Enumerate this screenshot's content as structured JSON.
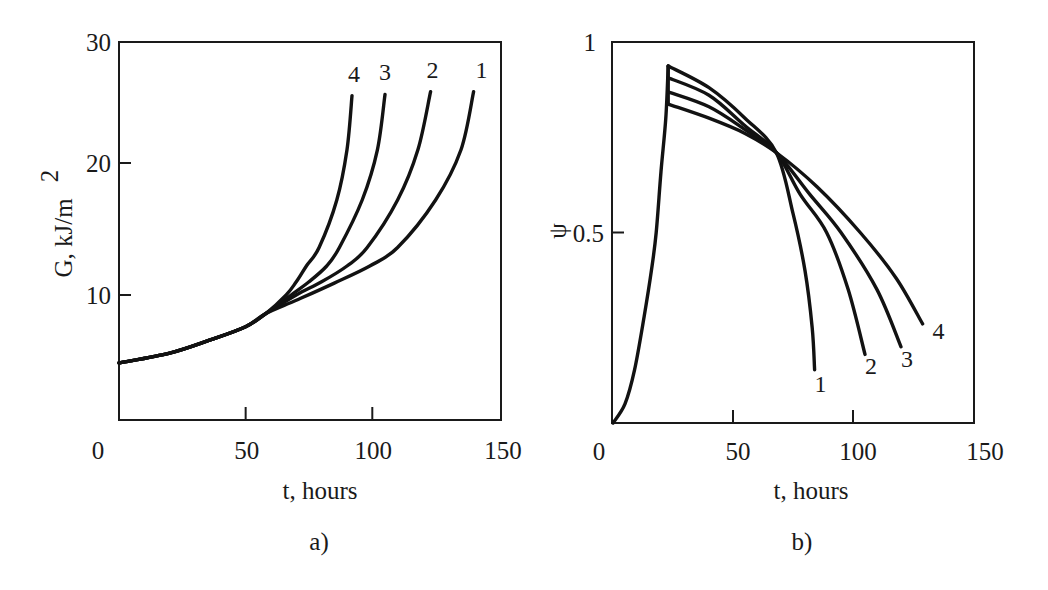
{
  "chart_data": [
    {
      "type": "line",
      "panel_label": "a)",
      "xlabel": "t, hours",
      "ylabel": "G, kJ/m",
      "ylabel_sup": "2",
      "xlim": [
        0,
        150
      ],
      "ylim": [
        0,
        30
      ],
      "xticks": [
        0,
        50,
        100,
        150
      ],
      "yticks": [
        10,
        20,
        30
      ],
      "grid": false,
      "legend": "inline numeric labels at curve ends",
      "series": [
        {
          "name": "1",
          "points": [
            [
              0,
              4.85
            ],
            [
              20,
              5.6
            ],
            [
              36,
              6.6
            ],
            [
              50,
              7.6
            ],
            [
              58,
              8.6
            ],
            [
              70,
              9.6
            ],
            [
              85,
              10.9
            ],
            [
              99,
              12.2
            ],
            [
              110,
              13.6
            ],
            [
              125,
              17.2
            ],
            [
              135,
              21.0
            ],
            [
              140,
              25.4
            ]
          ]
        },
        {
          "name": "2",
          "points": [
            [
              0,
              4.85
            ],
            [
              20,
              5.6
            ],
            [
              36,
              6.6
            ],
            [
              50,
              7.6
            ],
            [
              58,
              8.6
            ],
            [
              70,
              10.0
            ],
            [
              80,
              11.0
            ],
            [
              90,
              12.2
            ],
            [
              98,
              13.6
            ],
            [
              110,
              17.2
            ],
            [
              118,
              21.0
            ],
            [
              123,
              25.4
            ]
          ]
        },
        {
          "name": "3",
          "points": [
            [
              0,
              4.85
            ],
            [
              20,
              5.6
            ],
            [
              36,
              6.6
            ],
            [
              50,
              7.6
            ],
            [
              58,
              8.6
            ],
            [
              68,
              10.0
            ],
            [
              75,
              11.0
            ],
            [
              82,
              12.2
            ],
            [
              87,
              13.6
            ],
            [
              96,
              17.2
            ],
            [
              102,
              21.0
            ],
            [
              105,
              25.2
            ]
          ]
        },
        {
          "name": "4",
          "points": [
            [
              0,
              4.85
            ],
            [
              20,
              5.6
            ],
            [
              36,
              6.6
            ],
            [
              50,
              7.6
            ],
            [
              58,
              8.6
            ],
            [
              66,
              10.0
            ],
            [
              70,
              11.0
            ],
            [
              74,
              12.2
            ],
            [
              79,
              13.6
            ],
            [
              86,
              17.2
            ],
            [
              90,
              21.0
            ],
            [
              92,
              25.1
            ]
          ]
        }
      ]
    },
    {
      "type": "line",
      "panel_label": "b)",
      "xlabel": "t, hours",
      "ylabel": "ψ",
      "xlim": [
        0,
        150
      ],
      "ylim": [
        0,
        1
      ],
      "xticks": [
        0,
        50,
        100,
        150
      ],
      "yticks": [
        0.5,
        1
      ],
      "ytick_labels": [
        "0.5",
        "1"
      ],
      "grid": false,
      "legend": "inline numeric labels at curve ends",
      "rise": [
        [
          0,
          0
        ],
        [
          5,
          0.05
        ],
        [
          9,
          0.14
        ],
        [
          13,
          0.28
        ],
        [
          16,
          0.4
        ],
        [
          18,
          0.5
        ],
        [
          20,
          0.66
        ],
        [
          22,
          0.8
        ],
        [
          23,
          0.937
        ]
      ],
      "series": [
        {
          "name": "1",
          "points": [
            [
              23,
              0.937
            ],
            [
              40,
              0.88
            ],
            [
              55,
              0.8
            ],
            [
              68,
              0.71
            ],
            [
              75,
              0.55
            ],
            [
              80,
              0.4
            ],
            [
              83,
              0.25
            ],
            [
              84,
              0.14
            ]
          ]
        },
        {
          "name": "2",
          "points": [
            [
              23,
              0.906
            ],
            [
              40,
              0.86
            ],
            [
              55,
              0.78
            ],
            [
              68,
              0.71
            ],
            [
              78,
              0.6
            ],
            [
              89,
              0.5
            ],
            [
              98,
              0.35
            ],
            [
              105,
              0.18
            ]
          ]
        },
        {
          "name": "3",
          "points": [
            [
              23,
              0.869
            ],
            [
              40,
              0.83
            ],
            [
              55,
              0.77
            ],
            [
              68,
              0.71
            ],
            [
              82,
              0.6
            ],
            [
              95,
              0.5
            ],
            [
              110,
              0.35
            ],
            [
              120,
              0.2
            ]
          ]
        },
        {
          "name": "4",
          "points": [
            [
              23,
              0.837
            ],
            [
              40,
              0.8
            ],
            [
              55,
              0.76
            ],
            [
              68,
              0.71
            ],
            [
              85,
              0.62
            ],
            [
              103,
              0.5
            ],
            [
              118,
              0.38
            ],
            [
              129,
              0.26
            ]
          ]
        }
      ]
    }
  ]
}
